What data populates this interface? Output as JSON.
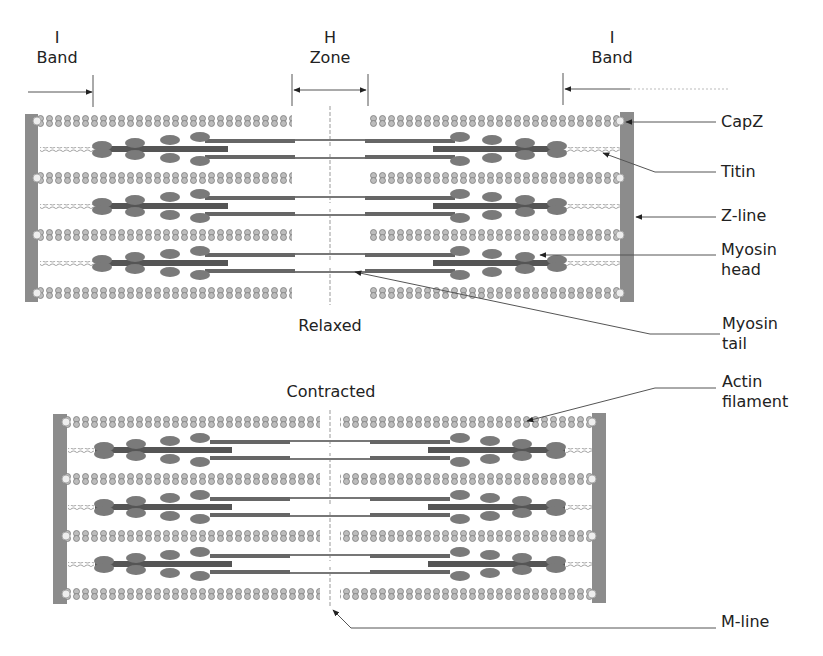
{
  "figure": {
    "colors": {
      "actin": "#9a9a9a",
      "myosin": "#555555",
      "myosin_head": "#7a7a7a",
      "z_line": "#8c8c8c",
      "titin": "#aaaaaa",
      "leader": "#555555",
      "text": "#222222"
    }
  },
  "top_labels": {
    "i_band_left": {
      "line1": "I",
      "line2": "Band"
    },
    "h_zone": {
      "line1": "H",
      "line2": "Zone"
    },
    "i_band_right": {
      "line1": "I",
      "line2": "Band"
    }
  },
  "states": {
    "relaxed": "Relaxed",
    "contracted": "Contracted"
  },
  "callouts": [
    {
      "id": "capz",
      "line1": "CapZ",
      "line2": ""
    },
    {
      "id": "titin",
      "line1": "Titin",
      "line2": ""
    },
    {
      "id": "z-line",
      "line1": "Z-line",
      "line2": ""
    },
    {
      "id": "myosin-head",
      "line1": "Myosin",
      "line2": "head"
    },
    {
      "id": "myosin-tail",
      "line1": "Myosin",
      "line2": "tail"
    },
    {
      "id": "actin-filament",
      "line1": "Actin",
      "line2": "filament"
    },
    {
      "id": "m-line",
      "line1": "M-line",
      "line2": ""
    }
  ]
}
